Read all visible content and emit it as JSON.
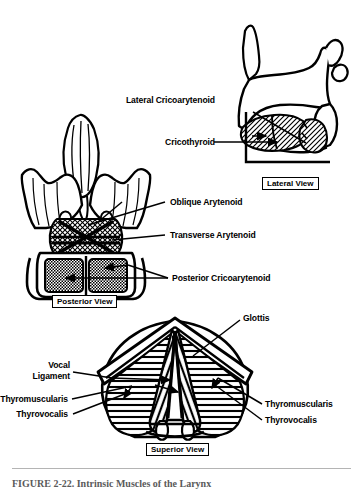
{
  "figure": {
    "title_caption": "FIGURE 2-22. Intrinsic Muscles of the Larynx",
    "background_color": "#ffffff",
    "ink_color": "#000000"
  },
  "views": [
    {
      "id": "lateral",
      "box_label": "Lateral View",
      "labels": [
        {
          "id": "lateral-cricoarytenoid",
          "text": "Lateral Cricoarytenoid"
        },
        {
          "id": "cricothyroid",
          "text": "Cricothyroid"
        }
      ]
    },
    {
      "id": "posterior",
      "box_label": "Posterior View",
      "labels": [
        {
          "id": "oblique-arytenoid",
          "text": "Oblique Arytenoid"
        },
        {
          "id": "transverse-arytenoid",
          "text": "Transverse Arytenoid"
        },
        {
          "id": "posterior-cricoarytenoid",
          "text": "Posterior Cricoarytenoid"
        }
      ]
    },
    {
      "id": "superior",
      "box_label": "Superior View",
      "labels": [
        {
          "id": "glottis",
          "text": "Glottis"
        },
        {
          "id": "vocal-ligament-line1",
          "text": "Vocal"
        },
        {
          "id": "vocal-ligament-line2",
          "text": "Ligament"
        },
        {
          "id": "thyromuscularis-left",
          "text": "Thyromuscularis"
        },
        {
          "id": "thyrovocalis-left",
          "text": "Thyrovocalis"
        },
        {
          "id": "thyromuscularis-right",
          "text": "Thyromuscularis"
        },
        {
          "id": "thyrovocalis-right",
          "text": "Thyrovocalis"
        }
      ]
    }
  ],
  "labels": {
    "lateral_cricoarytenoid": "Lateral Cricoarytenoid",
    "cricothyroid": "Cricothyroid",
    "lateral_view": "Lateral View",
    "oblique_arytenoid": "Oblique Arytenoid",
    "transverse_arytenoid": "Transverse Arytenoid",
    "posterior_cricoarytenoid": "Posterior Cricoarytenoid",
    "posterior_view": "Posterior View",
    "glottis": "Glottis",
    "vocal_line1": "Vocal",
    "vocal_line2": "Ligament",
    "thyromuscularis_left": "Thyromuscularis",
    "thyrovocalis_left": "Thyrovocalis",
    "thyromuscularis_right": "Thyromuscularis",
    "thyrovocalis_right": "Thyrovocalis",
    "superior_view": "Superior View",
    "caption": "FIGURE 2-22.  Intrinsic Muscles of the Larynx"
  }
}
